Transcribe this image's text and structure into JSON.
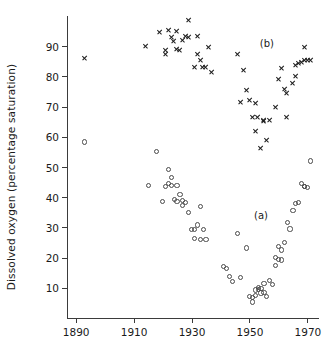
{
  "chart_data": {
    "type": "scatter",
    "title": "",
    "xlabel": "",
    "ylabel": "Dissolved oxygen (percentage saturation)",
    "xlim": [
      1887,
      1974
    ],
    "ylim": [
      0,
      100
    ],
    "xticks": [
      1890,
      1910,
      1930,
      1950,
      1970
    ],
    "yticks": [
      10,
      20,
      30,
      40,
      50,
      60,
      70,
      80,
      90
    ],
    "grid": false,
    "legend_position": "inline-annotations",
    "annotations": [
      {
        "text": "(b)",
        "x": 1956,
        "y": 91
      },
      {
        "text": "(a)",
        "x": 1954,
        "y": 34
      }
    ],
    "series": [
      {
        "name": "(b)",
        "marker": "x",
        "color": "#1c1c1c",
        "points": [
          [
            1893,
            86.0
          ],
          [
            1914,
            90.0
          ],
          [
            1919,
            94.8
          ],
          [
            1921,
            88.8
          ],
          [
            1921,
            87.5
          ],
          [
            1922,
            95.2
          ],
          [
            1923,
            93.0
          ],
          [
            1924,
            91.6
          ],
          [
            1925,
            95.0
          ],
          [
            1925,
            89.0
          ],
          [
            1926,
            88.8
          ],
          [
            1927,
            92.0
          ],
          [
            1928,
            93.3
          ],
          [
            1929,
            98.5
          ],
          [
            1929,
            93.0
          ],
          [
            1931,
            83.0
          ],
          [
            1932,
            93.2
          ],
          [
            1932,
            87.5
          ],
          [
            1933,
            85.5
          ],
          [
            1934,
            83.2
          ],
          [
            1935,
            83.0
          ],
          [
            1936,
            89.8
          ],
          [
            1937,
            81.5
          ],
          [
            1946,
            87.3
          ],
          [
            1947,
            71.3
          ],
          [
            1948,
            82.0
          ],
          [
            1949,
            75.3
          ],
          [
            1950,
            72.0
          ],
          [
            1951,
            66.5
          ],
          [
            1952,
            71.2
          ],
          [
            1952,
            62.0
          ],
          [
            1953,
            66.5
          ],
          [
            1954,
            56.3
          ],
          [
            1955,
            65.5
          ],
          [
            1955,
            65.3
          ],
          [
            1956,
            58.8
          ],
          [
            1957,
            65.5
          ],
          [
            1959,
            69.7
          ],
          [
            1960,
            79.2
          ],
          [
            1961,
            82.8
          ],
          [
            1962,
            75.8
          ],
          [
            1963,
            74.5
          ],
          [
            1963,
            66.6
          ],
          [
            1965,
            77.8
          ],
          [
            1966,
            80.0
          ],
          [
            1966,
            83.8
          ],
          [
            1967,
            84.5
          ],
          [
            1968,
            84.8
          ],
          [
            1969,
            89.8
          ],
          [
            1969,
            85.5
          ],
          [
            1970,
            85.5
          ],
          [
            1971,
            85.5
          ]
        ]
      },
      {
        "name": "(a)",
        "marker": "o",
        "color": "#4a4a4a",
        "points": [
          [
            1893,
            58.3
          ],
          [
            1915,
            44.0
          ],
          [
            1918,
            55.0
          ],
          [
            1920,
            38.5
          ],
          [
            1921,
            43.5
          ],
          [
            1922,
            44.5
          ],
          [
            1922,
            49.3
          ],
          [
            1923,
            46.5
          ],
          [
            1923,
            44.0
          ],
          [
            1924,
            39.3
          ],
          [
            1925,
            43.8
          ],
          [
            1925,
            38.5
          ],
          [
            1926,
            41.0
          ],
          [
            1927,
            39.0
          ],
          [
            1927,
            37.2
          ],
          [
            1928,
            38.3
          ],
          [
            1929,
            35.0
          ],
          [
            1930,
            29.3
          ],
          [
            1931,
            29.3
          ],
          [
            1931,
            26.3
          ],
          [
            1932,
            30.8
          ],
          [
            1933,
            36.8
          ],
          [
            1933,
            26.0
          ],
          [
            1934,
            29.3
          ],
          [
            1935,
            26.0
          ],
          [
            1941,
            17.0
          ],
          [
            1942,
            16.5
          ],
          [
            1943,
            13.8
          ],
          [
            1944,
            12.0
          ],
          [
            1946,
            28.0
          ],
          [
            1947,
            13.3
          ],
          [
            1949,
            23.2
          ],
          [
            1950,
            7.0
          ],
          [
            1951,
            6.8
          ],
          [
            1951,
            5.3
          ],
          [
            1952,
            9.3
          ],
          [
            1952,
            7.5
          ],
          [
            1953,
            10.0
          ],
          [
            1953,
            9.5
          ],
          [
            1954,
            8.3
          ],
          [
            1954,
            9.8
          ],
          [
            1955,
            8.5
          ],
          [
            1955,
            11.5
          ],
          [
            1956,
            7.0
          ],
          [
            1957,
            12.5
          ],
          [
            1958,
            11.2
          ],
          [
            1959,
            20.0
          ],
          [
            1959,
            17.3
          ],
          [
            1960,
            23.8
          ],
          [
            1960,
            19.5
          ],
          [
            1961,
            22.5
          ],
          [
            1961,
            19.2
          ],
          [
            1962,
            25.0
          ],
          [
            1963,
            31.5
          ],
          [
            1964,
            29.5
          ],
          [
            1965,
            35.5
          ],
          [
            1966,
            38.0
          ],
          [
            1967,
            38.3
          ],
          [
            1968,
            44.5
          ],
          [
            1969,
            43.5
          ],
          [
            1969,
            43.5
          ],
          [
            1970,
            43.3
          ],
          [
            1971,
            52.0
          ]
        ]
      }
    ]
  },
  "axes": {
    "y_title": "Dissolved oxygen (percentage saturation)",
    "x_tick_labels": [
      "1890",
      "1910",
      "1930",
      "1950",
      "1970"
    ],
    "y_tick_labels": [
      "10",
      "20",
      "30",
      "40",
      "50",
      "60",
      "70",
      "80",
      "90"
    ]
  }
}
